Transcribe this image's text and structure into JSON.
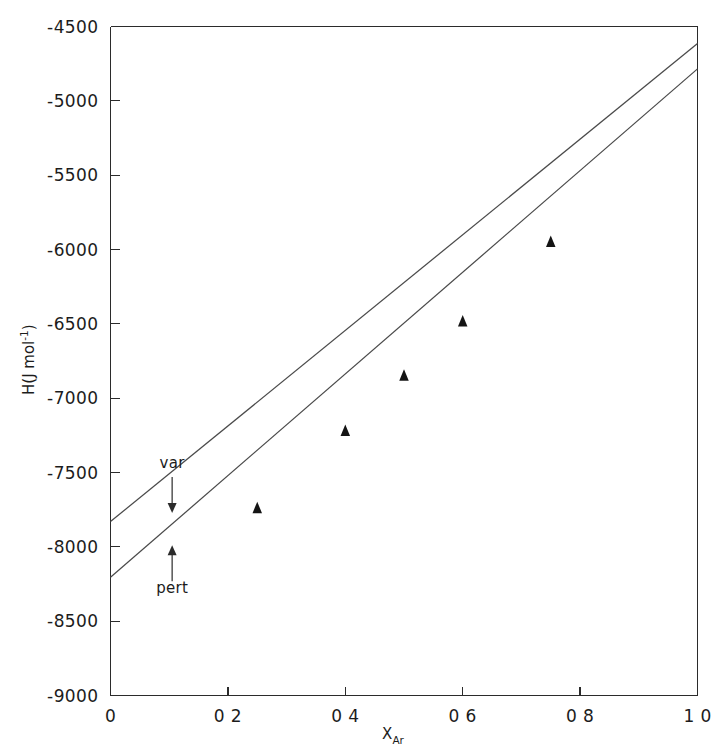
{
  "figure": {
    "background_color": "#ffffff",
    "ink_color": "#1c1c1c"
  },
  "chart_data": {
    "type": "line",
    "title": "",
    "subtitle": "",
    "xlabel_main": "X",
    "xlabel_subscript": "Ar",
    "ylabel_main": "H(J mol",
    "ylabel_superscript": "-1",
    "ylabel_tail": ")",
    "xlim": [
      0.0,
      1.0
    ],
    "ylim": [
      -9000,
      -4500
    ],
    "grid": false,
    "legend_position": "inline-annotations",
    "x_ticks": [
      0.0,
      0.2,
      0.4,
      0.6,
      0.8,
      1.0
    ],
    "x_tick_labels": [
      "0",
      "0 2",
      "0 4",
      "0 6",
      "0 8",
      "1 0"
    ],
    "y_ticks": [
      -9000,
      -8500,
      -8000,
      -7500,
      -7000,
      -6500,
      -6000,
      -5500,
      -5000,
      -4500
    ],
    "y_tick_labels": [
      "-9000",
      "-8500",
      "-8000",
      "-7500",
      "-7000",
      "-6500",
      "-6000",
      "-5500",
      "-5000",
      "-4500"
    ],
    "series": [
      {
        "name": "var",
        "label": "var",
        "style": "solid-line",
        "annotation_arrow": "down",
        "x": [
          0.0,
          1.0
        ],
        "values": [
          -7830,
          -4615
        ]
      },
      {
        "name": "pert",
        "label": "pert",
        "style": "solid-line",
        "annotation_arrow": "up",
        "x": [
          0.0,
          1.0
        ],
        "values": [
          -8205,
          -4785
        ]
      },
      {
        "name": "experimental",
        "label": "",
        "style": "filled-triangle-markers",
        "x": [
          0.25,
          0.4,
          0.5,
          0.6,
          0.75
        ],
        "values": [
          -7735,
          -7215,
          -6845,
          -6480,
          -5945
        ]
      }
    ],
    "annotations": [
      {
        "text": "var",
        "x": 0.105,
        "y": -7470,
        "arrow": "down"
      },
      {
        "text": "pert",
        "x": 0.105,
        "y": -8110,
        "arrow": "up"
      }
    ]
  }
}
